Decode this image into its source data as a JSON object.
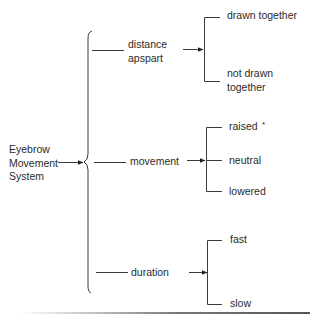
{
  "diagram": {
    "root": {
      "label_lines": [
        "Eyebrow",
        "Movement",
        "System"
      ]
    },
    "branches": [
      {
        "id": "distance",
        "label_lines": [
          "distance",
          "apspart"
        ],
        "children": [
          {
            "label_lines": [
              "drawn together"
            ]
          },
          {
            "label_lines": [
              "not drawn",
              "together"
            ]
          }
        ]
      },
      {
        "id": "movement",
        "label_lines": [
          "movement"
        ],
        "children": [
          {
            "label_lines": [
              "raised"
            ],
            "mark": "*"
          },
          {
            "label_lines": [
              "neutral"
            ]
          },
          {
            "label_lines": [
              "lowered"
            ]
          }
        ]
      },
      {
        "id": "duration",
        "label_lines": [
          "duration"
        ],
        "children": [
          {
            "label_lines": [
              "fast"
            ]
          },
          {
            "label_lines": [
              "slow"
            ]
          }
        ]
      }
    ]
  },
  "colors": {
    "line": "#333333",
    "text": "#2b2b2b",
    "background": "#ffffff"
  }
}
